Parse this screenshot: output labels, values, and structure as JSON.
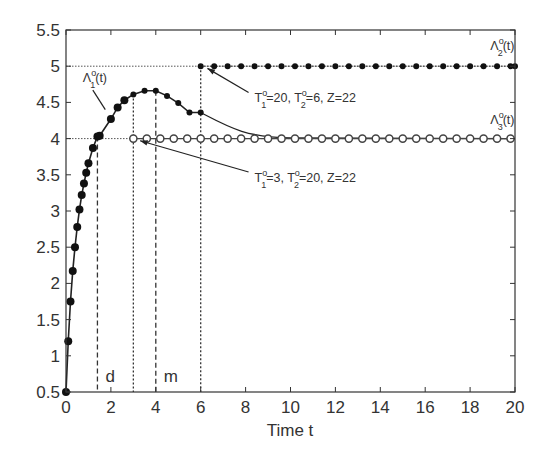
{
  "chart_data": {
    "type": "line",
    "title": "",
    "xlabel": "Time t",
    "ylabel": "",
    "xlim": [
      0,
      20
    ],
    "ylim": [
      0.5,
      5.5
    ],
    "xticks": [
      0,
      2,
      4,
      6,
      8,
      10,
      12,
      14,
      16,
      18,
      20
    ],
    "yticks": [
      0.5,
      1,
      1.5,
      2,
      2.5,
      3,
      3.5,
      4,
      4.5,
      5,
      5.5
    ],
    "xtick_labels": [
      "0",
      "2",
      "4",
      "6",
      "8",
      "10",
      "12",
      "14",
      "16",
      "18",
      "20"
    ],
    "ytick_labels": [
      "0.5",
      "1",
      "1.5",
      "2",
      "2.5",
      "3",
      "3.5",
      "4",
      "4.5",
      "5",
      "5.5"
    ],
    "grid": false,
    "series": [
      {
        "name": "Λ1°(t)",
        "marker": "filled-circle",
        "x": [
          0,
          0.1,
          0.2,
          0.3,
          0.4,
          0.5,
          0.6,
          0.7,
          0.8,
          0.9,
          1.0,
          1.2,
          1.4,
          1.5,
          2.0,
          2.3,
          2.6,
          3.0,
          3.5,
          4.0,
          4.5,
          5.0,
          5.5,
          6.0
        ],
        "y": [
          0.5,
          1.2,
          1.75,
          2.17,
          2.5,
          2.78,
          3.02,
          3.22,
          3.38,
          3.53,
          3.66,
          3.87,
          4.03,
          4.04,
          4.27,
          4.43,
          4.53,
          4.61,
          4.66,
          4.66,
          4.59,
          4.49,
          4.36,
          4.36
        ],
        "curve_after": {
          "x": [
            6,
            7,
            8,
            9,
            10,
            20
          ],
          "y": [
            4.36,
            4.2,
            4.08,
            4.03,
            4.02,
            4.0
          ]
        }
      },
      {
        "name": "Λ2°(t)",
        "marker": "filled-circle",
        "x": [
          6,
          6.6,
          7.2,
          7.8,
          8.4,
          9,
          9.6,
          10.2,
          10.8,
          11.4,
          12,
          12.6,
          13.2,
          13.8,
          14.4,
          15,
          15.6,
          16.2,
          16.8,
          17.4,
          18,
          18.6,
          19.2,
          19.8,
          20
        ],
        "y": [
          5,
          5,
          5,
          5,
          5,
          5,
          5,
          5,
          5,
          5,
          5,
          5,
          5,
          5,
          5,
          5,
          5,
          5,
          5,
          5,
          5,
          5,
          5,
          5,
          5
        ]
      },
      {
        "name": "Λ3°(t)",
        "marker": "open-circle",
        "x": [
          3,
          3.6,
          4.2,
          4.8,
          5.4,
          6,
          6.6,
          7.2,
          7.8,
          8.4,
          9,
          9.6,
          10.2,
          10.8,
          11.4,
          12,
          12.6,
          13.2,
          13.8,
          14.4,
          15,
          15.6,
          16.2,
          16.8,
          17.4,
          18,
          18.6,
          19.2,
          19.8
        ],
        "y": [
          4,
          4,
          4,
          4,
          4,
          4,
          4,
          4,
          4,
          4,
          4,
          4,
          4,
          4,
          4,
          4,
          4,
          4,
          4,
          4,
          4,
          4,
          4,
          4,
          4,
          4,
          4,
          4,
          4
        ]
      }
    ],
    "reference_lines": {
      "horizontal_dotted": [
        5,
        4
      ],
      "vertical": [
        {
          "x": 1.4,
          "style": "dashed",
          "label": "d"
        },
        {
          "x": 3,
          "style": "dotted",
          "label": ""
        },
        {
          "x": 4,
          "style": "dashed",
          "label": "m"
        },
        {
          "x": 6,
          "style": "dotted",
          "label": ""
        }
      ]
    },
    "annotations": [
      {
        "text": "Λ1°(t)",
        "main": "Λ",
        "sup": "o",
        "sub": "1",
        "tail": "(t)",
        "x": 0.75,
        "y": 4.78
      },
      {
        "text": "Λ2°(t)",
        "main": "Λ",
        "sup": "o",
        "sub": "2",
        "tail": "(t)",
        "x": 18.9,
        "y": 5.22
      },
      {
        "text": "Λ3°(t)",
        "main": "Λ",
        "sup": "o",
        "sub": "3",
        "tail": "(t)",
        "x": 18.9,
        "y": 4.2
      },
      {
        "text": "T1°=20, T2°=6, Z=22",
        "x": 8.4,
        "y": 4.5,
        "arrow_to": [
          6.3,
          4.97
        ]
      },
      {
        "text": "T1°=3, T2°=20, Z=22",
        "x": 8.4,
        "y": 3.4,
        "arrow_to": [
          3.3,
          3.97
        ]
      }
    ]
  }
}
